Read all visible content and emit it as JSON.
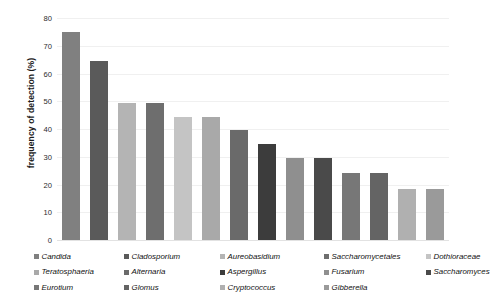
{
  "chart_data": {
    "type": "bar",
    "title": "",
    "xlabel": "",
    "ylabel": "frequency of detection (%)",
    "ylim": [
      0,
      80
    ],
    "ytick_step": 10,
    "ytick_labels": [
      "80",
      "70",
      "60",
      "50",
      "40",
      "30",
      "20",
      "10",
      "0"
    ],
    "ytick_values": [
      80,
      70,
      60,
      50,
      40,
      30,
      20,
      10,
      0
    ],
    "grid": true,
    "grid_axis": "y",
    "legend_position": "bottom",
    "categories": [
      "Candida",
      "Cladosporium",
      "Aureobasidium",
      "Saccharomycetales",
      "Dothioraceae",
      "Teratosphaeria",
      "Alternaria",
      "Aspergillus",
      "Fusarium",
      "Saccharomyces",
      "Eurotium",
      "Glomus",
      "Cryptococcus",
      "Gibberella"
    ],
    "values": [
      75,
      64.5,
      49.5,
      49.5,
      44.5,
      44.5,
      39.5,
      34.5,
      29.5,
      29.5,
      24,
      24,
      18.5,
      18.5
    ],
    "colors": [
      "#808080",
      "#5a5a5a",
      "#b4b4b4",
      "#6e6e6e",
      "#c4c4c4",
      "#a9a9a9",
      "#6a6a6a",
      "#3c3c3c",
      "#8f8f8f",
      "#4a4a4a",
      "#777777",
      "#646464",
      "#b0b0b0",
      "#9a9a9a"
    ]
  },
  "legend": {
    "rows": [
      [
        {
          "label": "Candida",
          "color": "#808080"
        },
        {
          "label": "Cladosporium",
          "color": "#5a5a5a"
        },
        {
          "label": "Aureobasidium",
          "color": "#b4b4b4"
        },
        {
          "label": "Saccharomycetales",
          "color": "#6e6e6e"
        },
        {
          "label": "Dothioraceae",
          "color": "#c4c4c4"
        }
      ],
      [
        {
          "label": "Teratosphaeria",
          "color": "#a9a9a9"
        },
        {
          "label": "Alternaria",
          "color": "#6a6a6a"
        },
        {
          "label": "Aspergillus",
          "color": "#3c3c3c"
        },
        {
          "label": "Fusarium",
          "color": "#8f8f8f"
        },
        {
          "label": "Saccharomyces",
          "color": "#4a4a4a"
        }
      ],
      [
        {
          "label": "Eurotium",
          "color": "#777777"
        },
        {
          "label": "Glomus",
          "color": "#646464"
        },
        {
          "label": "Cryptococcus",
          "color": "#b0b0b0"
        },
        {
          "label": "Gibberella",
          "color": "#9a9a9a"
        }
      ]
    ]
  }
}
